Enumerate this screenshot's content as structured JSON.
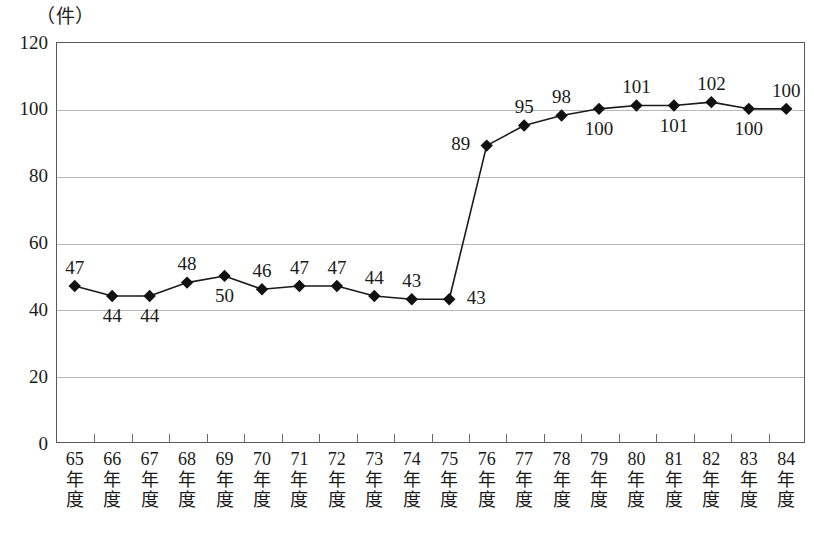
{
  "chart_data": {
    "type": "line",
    "title": "",
    "subtitle": "",
    "unit_label": "（件）",
    "xlabel": "",
    "ylabel": "",
    "ylim": [
      0,
      120
    ],
    "ytick_values": [
      0,
      20,
      40,
      60,
      80,
      100,
      120
    ],
    "ytick_labels": [
      "0",
      "20",
      "40",
      "60",
      "80",
      "100",
      "120"
    ],
    "grid": true,
    "legend": false,
    "legend_position": "none",
    "marker": "diamond",
    "categories": [
      "65年度",
      "66年度",
      "67年度",
      "68年度",
      "69年度",
      "70年度",
      "71年度",
      "72年度",
      "73年度",
      "74年度",
      "75年度",
      "76年度",
      "77年度",
      "78年度",
      "79年度",
      "80年度",
      "81年度",
      "82年度",
      "83年度",
      "84年度"
    ],
    "category_year_numbers": [
      "65",
      "66",
      "67",
      "68",
      "69",
      "70",
      "71",
      "72",
      "73",
      "74",
      "75",
      "76",
      "77",
      "78",
      "79",
      "80",
      "81",
      "82",
      "83",
      "84"
    ],
    "category_suffix_line1": "年",
    "category_suffix_line2": "度",
    "values": [
      47,
      44,
      44,
      48,
      50,
      46,
      47,
      47,
      44,
      43,
      43,
      89,
      95,
      98,
      100,
      101,
      101,
      102,
      100,
      100
    ],
    "data_labels": [
      "47",
      "44",
      "44",
      "48",
      "50",
      "46",
      "47",
      "47",
      "44",
      "43",
      "43",
      "89",
      "95",
      "98",
      "100",
      "101",
      "101",
      "102",
      "100",
      "100"
    ],
    "data_label_positions": [
      "above",
      "below",
      "below",
      "above",
      "below",
      "above",
      "above",
      "above",
      "above",
      "above",
      "right",
      "left",
      "above",
      "above",
      "below",
      "above",
      "below",
      "above",
      "below",
      "above"
    ],
    "series": [
      {
        "name": "件数",
        "values": [
          47,
          44,
          44,
          48,
          50,
          46,
          47,
          47,
          44,
          43,
          43,
          89,
          95,
          98,
          100,
          101,
          101,
          102,
          100,
          100
        ]
      }
    ],
    "colors": {
      "line": "#1a1a1a",
      "marker": "#111111",
      "grid": "#b9b9b9",
      "frame": "#5a5a5a",
      "text": "#1a1a1a"
    }
  }
}
